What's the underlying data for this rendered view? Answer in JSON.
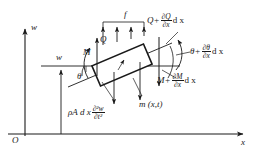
{
  "figure": {
    "type": "free-body-diagram",
    "background_color": "#ffffff",
    "stroke_color": "#1a1a1a",
    "axes": {
      "origin_label": "O",
      "vertical_axis_label": "w",
      "horizontal_axis_label": "x"
    },
    "labels": {
      "deflection": "w",
      "rotation": "θ",
      "moment_left": "M",
      "shear_left": "Q",
      "distributed_force": "f",
      "distributed_moment": "m (x,t)",
      "shear_right_base": "Q+",
      "shear_right_num": "∂Q",
      "shear_right_den": "∂x",
      "shear_right_tail": "d x",
      "rotation_right_base": "θ+",
      "rotation_right_num": "∂θ",
      "rotation_right_den": "∂x",
      "rotation_right_tail": "d x",
      "moment_right_base": "M+",
      "moment_right_num": "∂M",
      "moment_right_den": "∂x",
      "moment_right_tail": "d x",
      "inertia_base": "ρA d x",
      "inertia_num": "∂²w",
      "inertia_den": "∂t²"
    }
  }
}
